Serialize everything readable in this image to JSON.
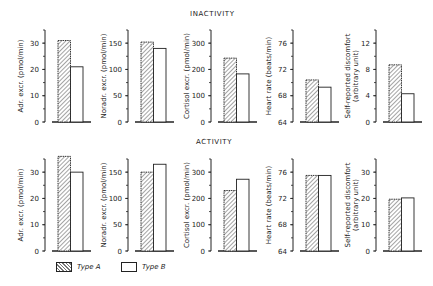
{
  "chart_data": [
    {
      "type": "bar",
      "row_title": "INACTIVITY",
      "panels": [
        {
          "ylabel": "Adr. excr. (pmol/min)",
          "ylim": [
            0,
            35
          ],
          "ticks": [
            0,
            10,
            20,
            30
          ],
          "series": [
            {
              "name": "Type A",
              "value": 31
            },
            {
              "name": "Type B",
              "value": 21
            }
          ]
        },
        {
          "ylabel": "Noradr. excr. (pmol/min)",
          "ylim": [
            0,
            175
          ],
          "ticks": [
            0,
            50,
            100,
            150
          ],
          "series": [
            {
              "name": "Type A",
              "value": 152
            },
            {
              "name": "Type B",
              "value": 140
            }
          ]
        },
        {
          "ylabel": "Cortisol excr. (pmol/min)",
          "ylim": [
            0,
            350
          ],
          "ticks": [
            0,
            100,
            200,
            300
          ],
          "series": [
            {
              "name": "Type A",
              "value": 243
            },
            {
              "name": "Type B",
              "value": 183
            }
          ]
        },
        {
          "ylabel": "Heart rate (beats/min)",
          "ylim": [
            64,
            78
          ],
          "ticks": [
            64,
            68,
            72,
            76
          ],
          "series": [
            {
              "name": "Type A",
              "value": 70.4
            },
            {
              "name": "Type B",
              "value": 69.3
            }
          ]
        },
        {
          "ylabel": "Self-reported discomfort (arbitrary unit)",
          "ylim": [
            0,
            14
          ],
          "ticks": [
            0,
            4,
            8,
            12
          ],
          "series": [
            {
              "name": "Type A",
              "value": 8.7
            },
            {
              "name": "Type B",
              "value": 4.3
            }
          ]
        }
      ]
    },
    {
      "type": "bar",
      "row_title": "ACTIVITY",
      "panels": [
        {
          "ylabel": "Adr. excr. (pmol/min)",
          "ylim": [
            0,
            35
          ],
          "ticks": [
            0,
            10,
            20,
            30
          ],
          "series": [
            {
              "name": "Type A",
              "value": 36
            },
            {
              "name": "Type B",
              "value": 30
            }
          ]
        },
        {
          "ylabel": "Noradr. excr. (pmol/min)",
          "ylim": [
            0,
            175
          ],
          "ticks": [
            0,
            50,
            100,
            150
          ],
          "series": [
            {
              "name": "Type A",
              "value": 150
            },
            {
              "name": "Type B",
              "value": 165
            }
          ]
        },
        {
          "ylabel": "Cortisol excr. (pmol/min)",
          "ylim": [
            0,
            350
          ],
          "ticks": [
            0,
            100,
            200,
            300
          ],
          "series": [
            {
              "name": "Type A",
              "value": 230
            },
            {
              "name": "Type B",
              "value": 273
            }
          ]
        },
        {
          "ylabel": "Heart rate (beats/min)",
          "ylim": [
            64,
            78
          ],
          "ticks": [
            64,
            68,
            72,
            76
          ],
          "series": [
            {
              "name": "Type A",
              "value": 75.5
            },
            {
              "name": "Type B",
              "value": 75.5
            }
          ]
        },
        {
          "ylabel": "Self-reported discomfort (arbitrary unit)",
          "ylim": [
            0,
            35
          ],
          "ticks": [
            0,
            10,
            20,
            30
          ],
          "series": [
            {
              "name": "Type A",
              "value": 19.7
            },
            {
              "name": "Type B",
              "value": 20.2
            }
          ]
        }
      ]
    }
  ],
  "legend": {
    "type_a": "Type A",
    "type_b": "Type B"
  },
  "titles": {
    "top": "INACTIVITY",
    "bottom": "ACTIVITY"
  }
}
